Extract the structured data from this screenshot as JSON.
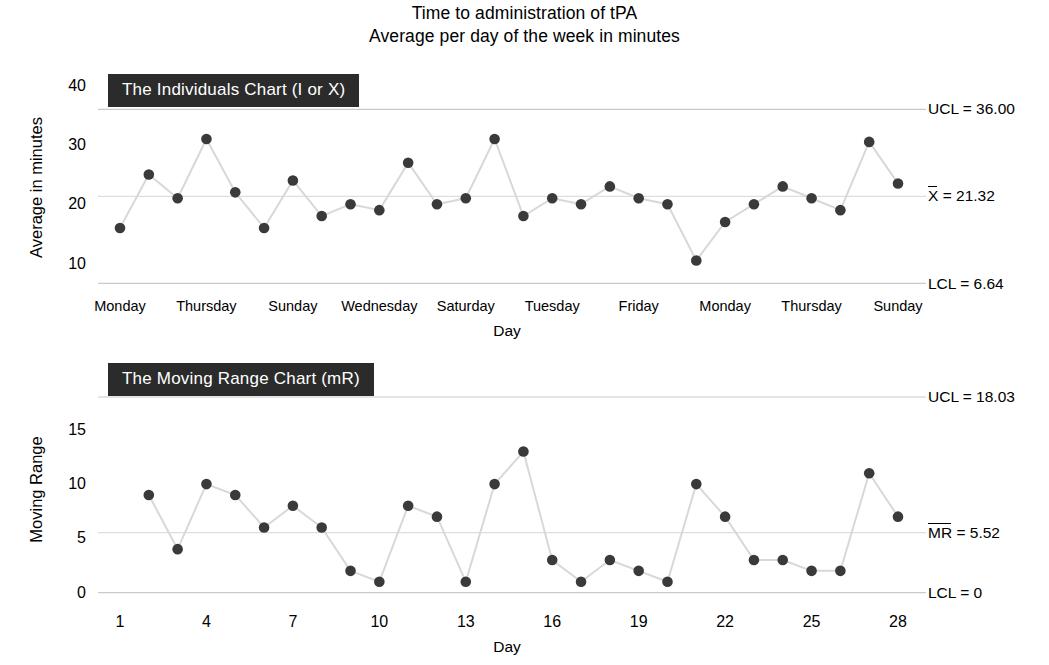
{
  "title": {
    "line1": "Time to administration of tPA",
    "line2": "Average per day of the week in minutes"
  },
  "chart_data": [
    {
      "type": "line",
      "id": "individuals-chart",
      "name": "The Individuals Chart (I or X)",
      "title": "Time to administration of tPA",
      "subtitle": "Average per day of the week in minutes",
      "xlabel": "Day",
      "ylabel": "Average in minutes",
      "ylim": [
        6,
        40
      ],
      "ytick_labels": [
        "40",
        "30",
        "20",
        "10"
      ],
      "ytick_values": [
        40,
        30,
        20,
        10
      ],
      "grid": false,
      "legend": "none",
      "x": [
        1,
        2,
        3,
        4,
        5,
        6,
        7,
        8,
        9,
        10,
        11,
        12,
        13,
        14,
        15,
        16,
        17,
        18,
        19,
        20,
        21,
        22,
        23,
        24,
        25,
        26,
        27,
        28
      ],
      "xtick_positions": [
        1,
        4,
        7,
        10,
        13,
        16,
        19,
        22,
        25,
        28
      ],
      "xtick_labels": [
        "Monday",
        "Thursday",
        "Sunday",
        "Wednesday",
        "Saturday",
        "Tuesday",
        "Friday",
        "Monday",
        "Thursday",
        "Sunday"
      ],
      "values": [
        16,
        25,
        21,
        31,
        22,
        16,
        24,
        18,
        20,
        19,
        27,
        20,
        21,
        31,
        18,
        21,
        20,
        23,
        21,
        20,
        10.5,
        17,
        20,
        23,
        21,
        19,
        30.5,
        23.5
      ],
      "control_lines": [
        {
          "name": "UCL",
          "label": "UCL = 36.00",
          "value": 36.0,
          "overline": false
        },
        {
          "name": "CL",
          "label": "X = 21.32",
          "value": 21.32,
          "overline": true,
          "symbol": "X",
          "number": "21.32"
        },
        {
          "name": "LCL",
          "label": "LCL = 6.64",
          "value": 6.64,
          "overline": false
        }
      ]
    },
    {
      "type": "line",
      "id": "moving-range-chart",
      "name": "The Moving Range Chart (mR)",
      "xlabel": "Day",
      "ylabel": "Moving Range",
      "ylim": [
        0,
        18.03
      ],
      "ytick_labels": [
        "15",
        "10",
        "5",
        "0"
      ],
      "ytick_values": [
        15,
        10,
        5,
        0
      ],
      "grid": false,
      "legend": "none",
      "x": [
        2,
        3,
        4,
        5,
        6,
        7,
        8,
        9,
        10,
        11,
        12,
        13,
        14,
        15,
        16,
        17,
        18,
        19,
        20,
        21,
        22,
        23,
        24,
        25,
        26,
        27,
        28
      ],
      "xtick_positions": [
        1,
        4,
        7,
        10,
        13,
        16,
        19,
        22,
        25,
        28
      ],
      "xtick_labels": [
        "1",
        "4",
        "7",
        "10",
        "13",
        "16",
        "19",
        "22",
        "25",
        "28"
      ],
      "values": [
        9,
        4,
        10,
        9,
        6,
        8,
        6,
        2,
        1,
        8,
        7,
        1,
        10,
        13,
        3,
        1,
        3,
        2,
        1,
        10,
        7,
        3,
        3,
        2,
        2,
        11,
        7
      ],
      "control_lines": [
        {
          "name": "UCL",
          "label": "UCL = 18.03",
          "value": 18.03,
          "overline": false
        },
        {
          "name": "CL",
          "label": "MR = 5.52",
          "value": 5.52,
          "overline": true,
          "symbol": "MR",
          "number": "5.52"
        },
        {
          "name": "LCL",
          "label": "LCL = 0",
          "value": 0,
          "overline": false
        }
      ]
    }
  ],
  "colors": {
    "marker": "#3a3a3a",
    "line": "#d8d8d8",
    "control_line": "#c9c9c9",
    "nameplate_bg": "#2b2b2b",
    "nameplate_text": "#ffffff",
    "text": "#000000"
  }
}
